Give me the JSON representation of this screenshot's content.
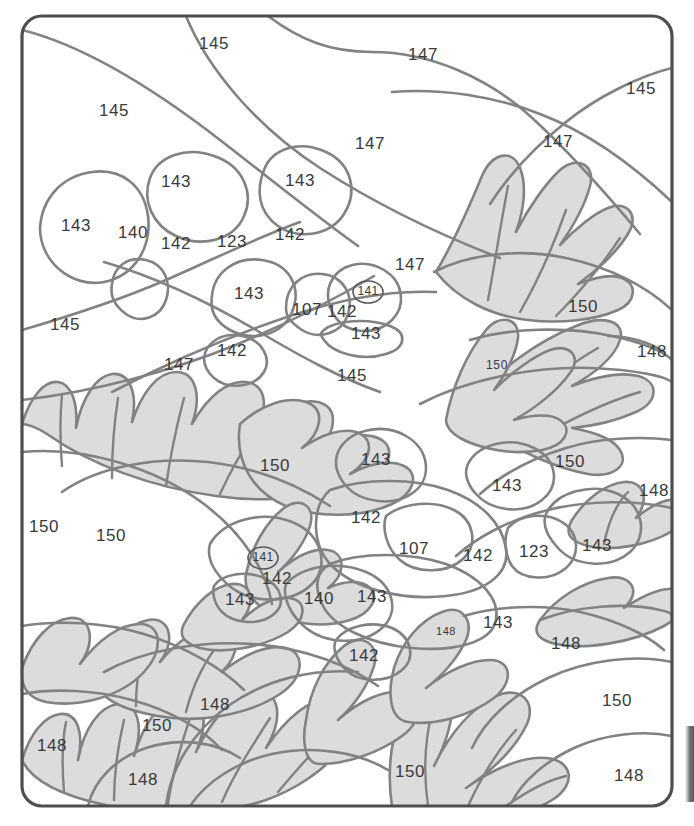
{
  "page": {
    "title_fragment": "",
    "width": 694,
    "height": 826,
    "background": "#ffffff"
  },
  "colors": {
    "frame_stroke": "#4e4e4e",
    "region_stroke": "#828282",
    "leaf_fill": "#dcdcdc",
    "white_fill": "#ffffff",
    "number_text": "#3a3a3a",
    "edge_bar": "#5c5c5c"
  },
  "frame": {
    "x": 22,
    "y": 16,
    "width": 650,
    "height": 790,
    "corner_radius": 20
  },
  "edge_bar": {
    "present": true,
    "x": 685,
    "y": 726,
    "width": 9,
    "height": 76
  },
  "legend_note": "color-by-number region codes",
  "numbers": [
    {
      "id": "n-145-top",
      "label": "145",
      "x": 214,
      "y": 45,
      "size": "normal",
      "circled": false
    },
    {
      "id": "n-147-top",
      "label": "147",
      "x": 423,
      "y": 56,
      "size": "normal",
      "circled": false
    },
    {
      "id": "n-145-topright",
      "label": "145",
      "x": 641,
      "y": 90,
      "size": "normal",
      "circled": false
    },
    {
      "id": "n-145-upperleft",
      "label": "145",
      "x": 114,
      "y": 112,
      "size": "normal",
      "circled": false
    },
    {
      "id": "n-147-uppermid",
      "label": "147",
      "x": 370,
      "y": 145,
      "size": "normal",
      "circled": false
    },
    {
      "id": "n-147-upperright",
      "label": "147",
      "x": 558,
      "y": 143,
      "size": "normal",
      "circled": false
    },
    {
      "id": "n-143-a",
      "label": "143",
      "x": 176,
      "y": 183,
      "size": "normal",
      "circled": false
    },
    {
      "id": "n-143-b",
      "label": "143",
      "x": 300,
      "y": 182,
      "size": "normal",
      "circled": false
    },
    {
      "id": "n-143-c",
      "label": "143",
      "x": 76,
      "y": 227,
      "size": "normal",
      "circled": false
    },
    {
      "id": "n-140-a",
      "label": "140",
      "x": 133,
      "y": 234,
      "size": "normal",
      "circled": false
    },
    {
      "id": "n-142-a",
      "label": "142",
      "x": 176,
      "y": 245,
      "size": "normal",
      "circled": false
    },
    {
      "id": "n-123-a",
      "label": "123",
      "x": 232,
      "y": 243,
      "size": "normal",
      "circled": false
    },
    {
      "id": "n-142-b",
      "label": "142",
      "x": 290,
      "y": 236,
      "size": "normal",
      "circled": false
    },
    {
      "id": "n-147-mid",
      "label": "147",
      "x": 410,
      "y": 266,
      "size": "normal",
      "circled": false
    },
    {
      "id": "n-143-d",
      "label": "143",
      "x": 249,
      "y": 295,
      "size": "normal",
      "circled": false
    },
    {
      "id": "n-107-a",
      "label": "107",
      "x": 307,
      "y": 311,
      "size": "normal",
      "circled": false
    },
    {
      "id": "n-142-c",
      "label": "142",
      "x": 342,
      "y": 313,
      "size": "normal",
      "circled": false
    },
    {
      "id": "n-141-a",
      "label": "141",
      "x": 368,
      "y": 292,
      "size": "small",
      "circled": true
    },
    {
      "id": "n-143-e",
      "label": "143",
      "x": 366,
      "y": 335,
      "size": "normal",
      "circled": false
    },
    {
      "id": "n-150-right-a",
      "label": "150",
      "x": 583,
      "y": 308,
      "size": "normal",
      "circled": false
    },
    {
      "id": "n-145-left",
      "label": "145",
      "x": 65,
      "y": 326,
      "size": "normal",
      "circled": false
    },
    {
      "id": "n-142-d",
      "label": "142",
      "x": 232,
      "y": 352,
      "size": "normal",
      "circled": false
    },
    {
      "id": "n-147-left",
      "label": "147",
      "x": 179,
      "y": 366,
      "size": "normal",
      "circled": false
    },
    {
      "id": "n-145-mid",
      "label": "145",
      "x": 352,
      "y": 377,
      "size": "normal",
      "circled": false
    },
    {
      "id": "n-150-small-a",
      "label": "150",
      "x": 497,
      "y": 366,
      "size": "small",
      "circled": false
    },
    {
      "id": "n-148-right-a",
      "label": "148",
      "x": 652,
      "y": 353,
      "size": "normal",
      "circled": false
    },
    {
      "id": "n-150-b",
      "label": "150",
      "x": 275,
      "y": 467,
      "size": "normal",
      "circled": false
    },
    {
      "id": "n-143-f",
      "label": "143",
      "x": 376,
      "y": 461,
      "size": "normal",
      "circled": false
    },
    {
      "id": "n-143-g",
      "label": "143",
      "x": 507,
      "y": 487,
      "size": "normal",
      "circled": false
    },
    {
      "id": "n-150-c",
      "label": "150",
      "x": 570,
      "y": 463,
      "size": "normal",
      "circled": false
    },
    {
      "id": "n-148-right-b",
      "label": "148",
      "x": 654,
      "y": 492,
      "size": "normal",
      "circled": false
    },
    {
      "id": "n-150-edge",
      "label": "150",
      "x": 44,
      "y": 528,
      "size": "normal",
      "circled": false
    },
    {
      "id": "n-150-d",
      "label": "150",
      "x": 111,
      "y": 537,
      "size": "normal",
      "circled": false
    },
    {
      "id": "n-142-e",
      "label": "142",
      "x": 366,
      "y": 519,
      "size": "normal",
      "circled": false
    },
    {
      "id": "n-107-b",
      "label": "107",
      "x": 414,
      "y": 550,
      "size": "normal",
      "circled": false
    },
    {
      "id": "n-142-f",
      "label": "142",
      "x": 478,
      "y": 557,
      "size": "normal",
      "circled": false
    },
    {
      "id": "n-123-b",
      "label": "123",
      "x": 534,
      "y": 553,
      "size": "normal",
      "circled": false
    },
    {
      "id": "n-143-h",
      "label": "143",
      "x": 597,
      "y": 547,
      "size": "normal",
      "circled": false
    },
    {
      "id": "n-141-b",
      "label": "141",
      "x": 263,
      "y": 558,
      "size": "small",
      "circled": true
    },
    {
      "id": "n-142-g",
      "label": "142",
      "x": 277,
      "y": 580,
      "size": "normal",
      "circled": false
    },
    {
      "id": "n-143-i",
      "label": "143",
      "x": 240,
      "y": 601,
      "size": "normal",
      "circled": false
    },
    {
      "id": "n-140-b",
      "label": "140",
      "x": 319,
      "y": 600,
      "size": "normal",
      "circled": false
    },
    {
      "id": "n-143-j",
      "label": "143",
      "x": 372,
      "y": 598,
      "size": "normal",
      "circled": false
    },
    {
      "id": "n-148-tiny",
      "label": "148",
      "x": 446,
      "y": 632,
      "size": "tiny",
      "circled": false
    },
    {
      "id": "n-143-k",
      "label": "143",
      "x": 498,
      "y": 624,
      "size": "normal",
      "circled": false
    },
    {
      "id": "n-148-mid-right",
      "label": "148",
      "x": 566,
      "y": 645,
      "size": "normal",
      "circled": false
    },
    {
      "id": "n-142-h",
      "label": "142",
      "x": 364,
      "y": 657,
      "size": "normal",
      "circled": false
    },
    {
      "id": "n-150-right-b",
      "label": "150",
      "x": 617,
      "y": 702,
      "size": "normal",
      "circled": false
    },
    {
      "id": "n-148-c",
      "label": "148",
      "x": 215,
      "y": 706,
      "size": "normal",
      "circled": false
    },
    {
      "id": "n-150-e",
      "label": "150",
      "x": 157,
      "y": 727,
      "size": "normal",
      "circled": false
    },
    {
      "id": "n-148-left",
      "label": "148",
      "x": 52,
      "y": 747,
      "size": "normal",
      "circled": false
    },
    {
      "id": "n-148-bottom",
      "label": "148",
      "x": 143,
      "y": 781,
      "size": "normal",
      "circled": false
    },
    {
      "id": "n-150-bottom",
      "label": "150",
      "x": 410,
      "y": 773,
      "size": "normal",
      "circled": false
    },
    {
      "id": "n-148-bottomright",
      "label": "148",
      "x": 629,
      "y": 777,
      "size": "normal",
      "circled": false
    }
  ],
  "chart_data": {
    "type": "table",
    "categories": [
      "107",
      "123",
      "140",
      "141",
      "142",
      "143",
      "145",
      "147",
      "148",
      "150"
    ],
    "values": [
      2,
      2,
      2,
      2,
      8,
      11,
      5,
      5,
      8,
      9
    ],
    "xlabel": "color code",
    "ylabel": "region count"
  }
}
